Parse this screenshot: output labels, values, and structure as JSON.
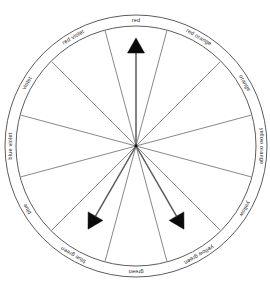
{
  "figure": {
    "type": "color-wheel-diagram",
    "center": {
      "x": 136,
      "y": 146
    },
    "outer_ring_radius": 131,
    "inner_ring_radius": 120,
    "wheel_radius": 119,
    "segment_count": 12,
    "background_color": "#ffffff",
    "line_color": "#4a4a4a",
    "arrow_color": "#0a0a0a"
  },
  "segments": [
    {
      "label": "red",
      "angle_deg": 0,
      "index": 0
    },
    {
      "label": "red orange",
      "angle_deg": 30,
      "index": 1
    },
    {
      "label": "orange",
      "angle_deg": 60,
      "index": 2
    },
    {
      "label": "yellow orange",
      "angle_deg": 90,
      "index": 3
    },
    {
      "label": "yellow",
      "angle_deg": 120,
      "index": 4
    },
    {
      "label": "yellow green",
      "angle_deg": 150,
      "index": 5
    },
    {
      "label": "green",
      "angle_deg": 180,
      "index": 6
    },
    {
      "label": "blue green",
      "angle_deg": 210,
      "index": 7
    },
    {
      "label": "blue",
      "angle_deg": 240,
      "index": 8
    },
    {
      "label": "blue violet",
      "angle_deg": 270,
      "index": 9
    },
    {
      "label": "violet",
      "angle_deg": 300,
      "index": 10
    },
    {
      "label": "red violet",
      "angle_deg": 330,
      "index": 11
    }
  ],
  "arrows": [
    {
      "name": "arrow-red",
      "points_to": "red",
      "angle_deg": 0,
      "length": 108
    },
    {
      "name": "arrow-yellow-green",
      "points_to": "yellow green",
      "angle_deg": 150,
      "length": 96
    },
    {
      "name": "arrow-blue-green",
      "points_to": "blue green",
      "angle_deg": 210,
      "length": 96
    }
  ],
  "chart_data": {
    "type": "pie",
    "categories": [
      "red",
      "red orange",
      "orange",
      "yellow orange",
      "yellow",
      "yellow green",
      "green",
      "blue green",
      "blue",
      "blue violet",
      "violet",
      "red violet"
    ],
    "values": [
      30,
      30,
      30,
      30,
      30,
      30,
      30,
      30,
      30,
      30,
      30,
      30
    ],
    "xlabel": "",
    "ylabel": "",
    "legend_position": "ring",
    "grid": false,
    "annotations": [
      "arrow to red",
      "arrow to yellow green",
      "arrow to blue green"
    ]
  }
}
